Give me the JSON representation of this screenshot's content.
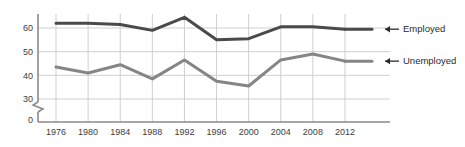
{
  "chart_data": {
    "type": "line",
    "title": "",
    "subtitle": "",
    "xlabel": "",
    "ylabel": "",
    "categories": [
      1976,
      1980,
      1984,
      1988,
      1992,
      1996,
      2000,
      2004,
      2008,
      2012
    ],
    "x_tick_labels": [
      "1976",
      "1980",
      "1984",
      "1988",
      "1992",
      "1996",
      "2000",
      "2004",
      "2008",
      "2012"
    ],
    "y_tick_labels": [
      "0",
      "30",
      "40",
      "50",
      "60"
    ],
    "y_tick_values": [
      0,
      30,
      40,
      50,
      60
    ],
    "ylim": [
      30,
      66
    ],
    "axis_break": true,
    "axis_break_note": "zigzag break on y-axis between 0 and 30",
    "grid": true,
    "grid_color": "#c9c9c9",
    "legend_position": "right-inline-arrows",
    "series": [
      {
        "name": "Employed",
        "label": "Employed",
        "color": "#4a4a4a",
        "values": [
          62,
          62,
          61.5,
          59,
          64.5,
          55,
          55.5,
          60.5,
          60.5,
          59.5
        ]
      },
      {
        "name": "Unemployed",
        "label": "Unemployed",
        "color": "#858585",
        "values": [
          43.5,
          41,
          44.5,
          38.5,
          46.5,
          37.5,
          35.5,
          46.5,
          49,
          46
        ]
      }
    ],
    "annotations": [
      {
        "name": "employed-arrow",
        "glyph": "arrow-left",
        "target": "Employed"
      },
      {
        "name": "unemployed-arrow",
        "glyph": "arrow-left",
        "target": "Unemployed"
      }
    ]
  },
  "colors": {
    "background": "#ffffff",
    "axis": "#8a8a8a",
    "grid": "#c9c9c9",
    "tick_label": "#3d3d3d",
    "legend_label": "#2b2b2b",
    "employed": "#4a4a4a",
    "unemployed": "#858585"
  }
}
